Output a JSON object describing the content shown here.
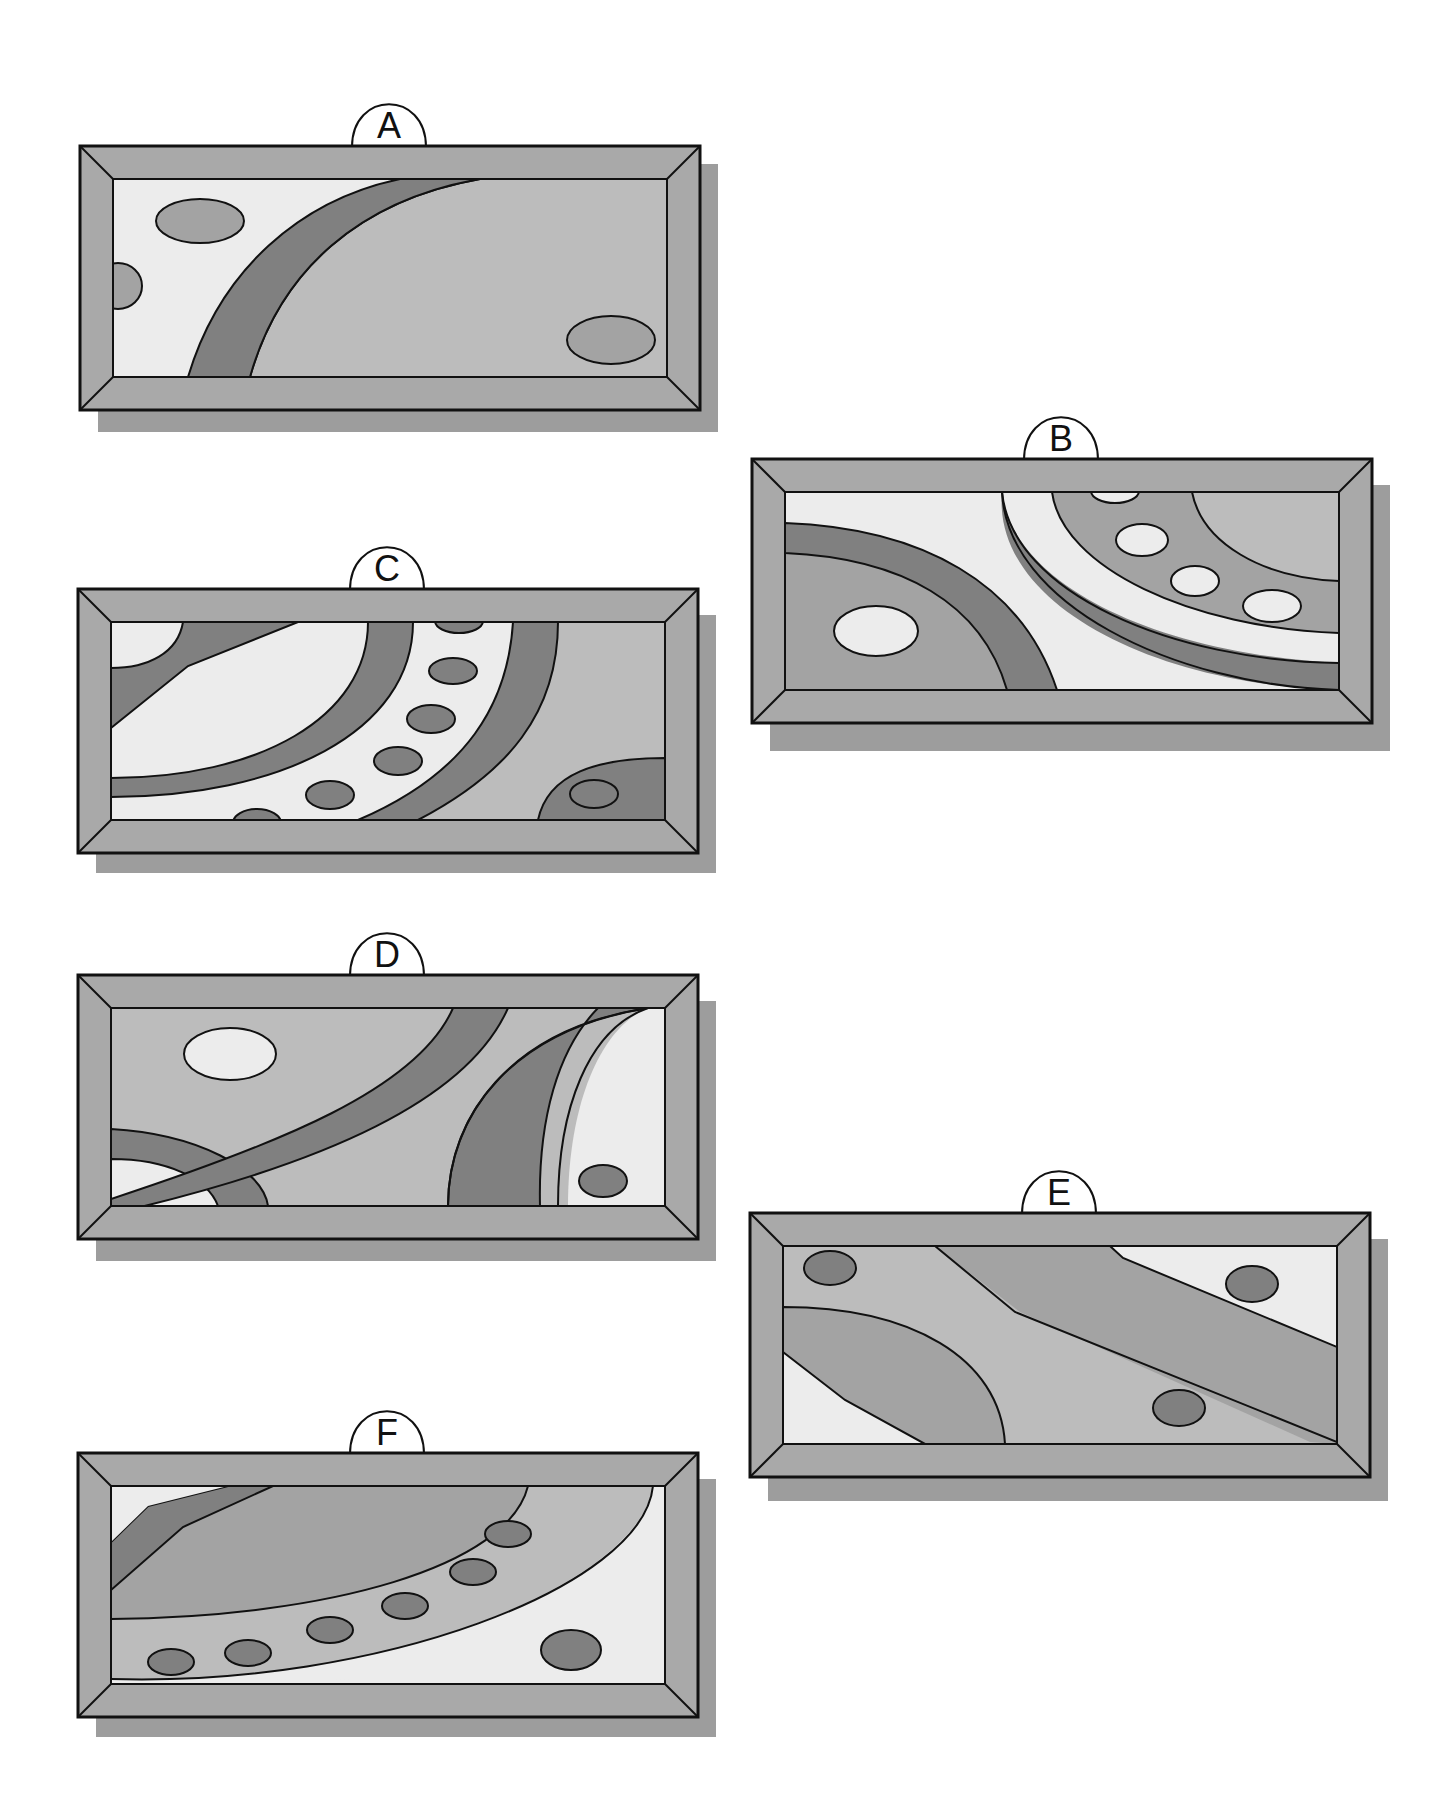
{
  "colors": {
    "frame": "#a9a9a9",
    "shadow": "#9d9d9d",
    "light": "#ececec",
    "mid": "#bcbcbc",
    "medium": "#a3a3a3",
    "dark": "#808080",
    "stroke": "#111111"
  },
  "panels": [
    {
      "id": "A",
      "label": "A"
    },
    {
      "id": "B",
      "label": "B"
    },
    {
      "id": "C",
      "label": "C"
    },
    {
      "id": "D",
      "label": "D"
    },
    {
      "id": "E",
      "label": "E"
    },
    {
      "id": "F",
      "label": "F"
    }
  ]
}
